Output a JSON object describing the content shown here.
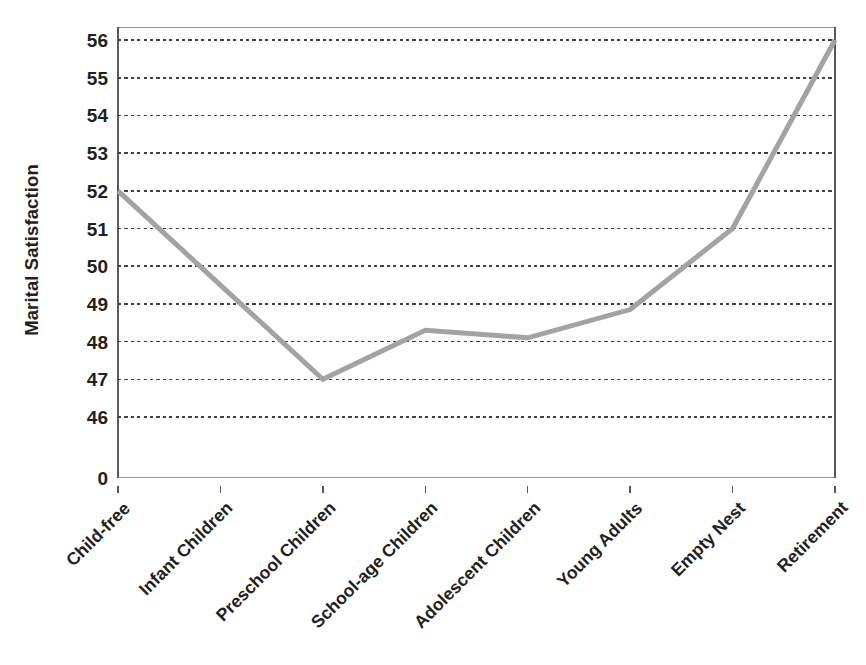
{
  "chart_data": {
    "type": "line",
    "title": "",
    "xlabel": "",
    "ylabel": "Marital Satisfaction",
    "categories": [
      "Child-free",
      "Infant Children",
      "Preschool Children",
      "School-age Children",
      "Adolescent Children",
      "Young Adults",
      "Empty Nest",
      "Retirement"
    ],
    "values": [
      52,
      49.5,
      47,
      48.3,
      48.1,
      48.85,
      51.0,
      56
    ],
    "series": [
      {
        "name": "Marital Satisfaction",
        "values": [
          52,
          49.5,
          47,
          48.3,
          48.1,
          48.85,
          51.0,
          56
        ]
      }
    ],
    "ylim": [
      46,
      56
    ],
    "ytick_labels": [
      "56",
      "55",
      "54",
      "53",
      "52",
      "51",
      "50",
      "49",
      "48",
      "47",
      "46",
      "0"
    ],
    "ytick_values": [
      56,
      55,
      54,
      53,
      52,
      51,
      50,
      49,
      48,
      47,
      46,
      0
    ],
    "axis_break": true,
    "grid": true,
    "grid_style": "dotted",
    "legend": false,
    "legend_position": "none",
    "line_color": "#a3a3a3",
    "grid_color": "#3f3f3f",
    "axis_color": "#595959",
    "text_color": "#231f20",
    "background_color": "#ffffff",
    "line_width": 5
  }
}
